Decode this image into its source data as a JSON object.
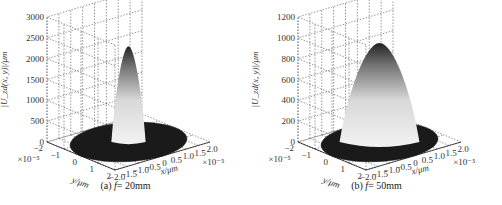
{
  "chart_data": [
    {
      "type": "surface3d",
      "panel": "a",
      "caption_prefix": "(a)",
      "caption_var": "f",
      "caption_value": "= 20mm",
      "zlabel": "|U_zd(x, y)|/μm",
      "xlabel": "x/μm",
      "ylabel": "y/μm",
      "x_scale": "×10⁻⁵",
      "y_scale": "×10⁻⁵",
      "zticks": [
        "0",
        "500",
        "1000",
        "1500",
        "2000",
        "2500",
        "3000"
      ],
      "zlim": [
        0,
        3000
      ],
      "xticks": [
        "−2.0",
        "−1.5",
        "−1.0",
        "−0.5",
        "0",
        "0.5",
        "1.0",
        "1.5",
        "2.0"
      ],
      "yticks": [
        "−2",
        "−1",
        "0",
        "1",
        "2"
      ],
      "peak_value": 2300,
      "peak_width_rel": 0.18,
      "colormap": "gray",
      "grid": true
    },
    {
      "type": "surface3d",
      "panel": "b",
      "caption_prefix": "(b)",
      "caption_var": "f",
      "caption_value": "= 50mm",
      "zlabel": "|U_zd(x, y)|/μm",
      "xlabel": "x/μm",
      "ylabel": "y/μm",
      "x_scale": "×10⁻⁵",
      "y_scale": "×10⁻⁵",
      "zticks": [
        "0",
        "200",
        "400",
        "600",
        "800",
        "1000",
        "1200"
      ],
      "zlim": [
        0,
        1200
      ],
      "xticks": [
        "−2.0",
        "−1.5",
        "−1.0",
        "−0.5",
        "0",
        "0.5",
        "1.0",
        "1.5",
        "2.0"
      ],
      "yticks": [
        "−2",
        "−1",
        "0",
        "1",
        "2"
      ],
      "peak_value": 950,
      "peak_width_rel": 0.42,
      "colormap": "gray",
      "grid": true
    }
  ]
}
